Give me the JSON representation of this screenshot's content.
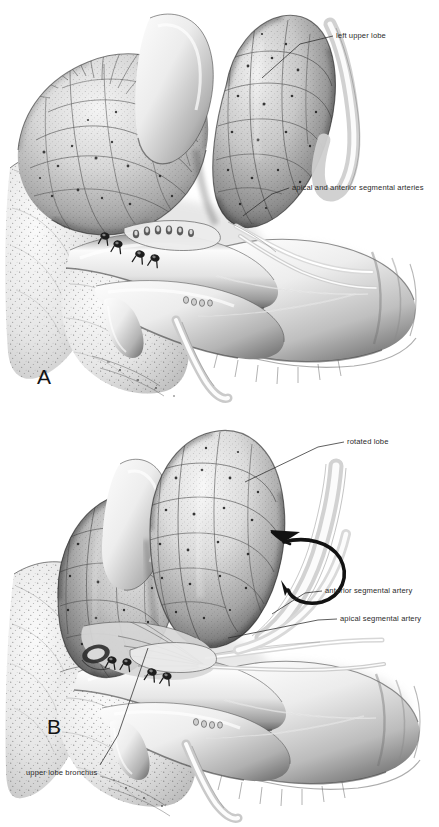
{
  "figure": {
    "type": "medical-surgical-illustration",
    "style": "pen-and-ink stipple / airbrush halftone, grayscale",
    "background_color": "#ffffff",
    "ink_color": "#2b2b2b",
    "width": 439,
    "height": 827
  },
  "panels": [
    {
      "id": "A",
      "letter": "A",
      "letter_pos": {
        "x": 37,
        "y": 365
      },
      "bounds": {
        "x": 0,
        "y": 0,
        "w": 439,
        "h": 410
      },
      "caption_labels": [
        {
          "id": "left-upper-lobe",
          "text": "left upper lobe",
          "text_pos": {
            "x": 336,
            "y": 31
          },
          "leader": [
            [
              333,
              36
            ],
            [
              300,
              44
            ],
            [
              262,
              78
            ]
          ]
        },
        {
          "id": "apical-and-anterior-segmental-arteries",
          "text": "apical and anterior segmental arteries",
          "text_pos": {
            "x": 292,
            "y": 183
          },
          "leader": [
            [
              289,
              188
            ],
            [
              272,
              194
            ],
            [
              243,
              216
            ]
          ]
        }
      ]
    },
    {
      "id": "B",
      "letter": "B",
      "letter_pos": {
        "x": 47,
        "y": 715
      },
      "bounds": {
        "x": 0,
        "y": 410,
        "w": 439,
        "h": 417
      },
      "caption_labels": [
        {
          "id": "rotated-lobe",
          "text": "rotated lobe",
          "text_pos": {
            "x": 347,
            "y": 437
          },
          "leader": [
            [
              344,
              442
            ],
            [
              318,
              447
            ],
            [
              245,
              482
            ]
          ]
        },
        {
          "id": "anterior-segmental-artery",
          "text": "anterior segmental artery",
          "text_pos": {
            "x": 325,
            "y": 586
          },
          "leader": [
            [
              322,
              591
            ],
            [
              305,
              593
            ],
            [
              272,
              614
            ]
          ]
        },
        {
          "id": "apical-segmental-artery",
          "text": "apical segmental artery",
          "text_pos": {
            "x": 340,
            "y": 614
          },
          "leader": [
            [
              337,
              619
            ],
            [
              318,
              620
            ],
            [
              228,
              638
            ]
          ]
        },
        {
          "id": "upper-lobe-bronchus",
          "text": "upper lobe bronchus",
          "text_pos": {
            "x": 26,
            "y": 768
          },
          "leader": [
            [
              100,
              765
            ],
            [
              118,
              735
            ],
            [
              148,
              648
            ]
          ]
        }
      ],
      "annotations": [
        {
          "id": "rotation-arrow",
          "kind": "curved-rotation-arrow",
          "description": "arrow curving around the pulmonary artery indicating direction of lobe rotation",
          "anchor": {
            "x": 312,
            "y": 540
          }
        }
      ]
    }
  ],
  "anatomy": {
    "panel_a_structures": [
      "left upper lobe",
      "left lower lobe",
      "pulmonary artery trunk",
      "apical segmental artery",
      "anterior segmental artery",
      "ligated branch stumps with suture knots",
      "pericardium / mediastinal tissue",
      "superior pulmonary vein"
    ],
    "panel_b_structures": [
      "rotated left upper lobe",
      "left lower lobe",
      "anterior segmental artery",
      "apical segmental artery",
      "upper lobe bronchus",
      "pulmonary artery",
      "ligated branch stumps with suture knots",
      "mediastinal pleura"
    ],
    "suture_knots_panel_a": 4,
    "suture_knots_panel_b": 4
  }
}
